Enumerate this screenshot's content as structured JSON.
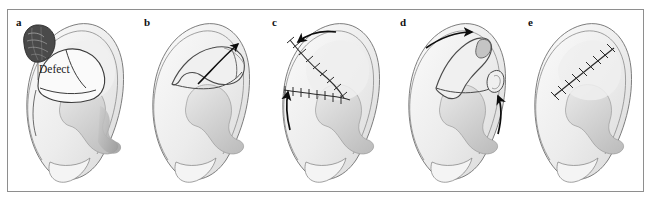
{
  "figure": {
    "type": "medical-illustration",
    "border_color": "#8e8e8e",
    "background_color": "#ffffff",
    "panel_count": 5
  },
  "palette": {
    "outline": "#3b3b3b",
    "outline_light": "#7a7a7a",
    "skin_light": "#f2f2f2",
    "skin_mid": "#e2e2e2",
    "skin_shadow": "#c9c9c9",
    "skin_dark": "#a8a8a8",
    "lesion_dark": "#4a4a4a",
    "lesion_mid": "#6e6e6e",
    "arrow": "#0d0d0d",
    "suture": "#2b2b2b",
    "text": "#111111"
  },
  "panels": [
    {
      "id": "a",
      "label": "a",
      "label_x": 8,
      "label_y": 6,
      "caption_text": "Defect",
      "caption_x": 31,
      "caption_y": 53,
      "has_lesion": true,
      "has_arrow": false,
      "has_sutures": false,
      "description": "Ear with pigmented lesion at superior helix and outlined surgical defect"
    },
    {
      "id": "b",
      "label": "b",
      "label_x": 8,
      "label_y": 6,
      "caption_text": "",
      "has_lesion": false,
      "has_arrow": true,
      "arrow_count": 1,
      "has_sutures": false,
      "description": "Flap incision outlined with single arrow indicating direction of flap transposition"
    },
    {
      "id": "c",
      "label": "c",
      "label_x": 8,
      "label_y": 6,
      "caption_text": "",
      "has_lesion": false,
      "has_arrow": true,
      "arrow_count": 2,
      "has_sutures": true,
      "description": "Flap sutured into position with two arrows showing advancement vectors"
    },
    {
      "id": "d",
      "label": "d",
      "label_x": 8,
      "label_y": 6,
      "caption_text": "",
      "has_lesion": false,
      "has_arrow": true,
      "arrow_count": 2,
      "has_sutures": false,
      "description": "Alternative flap design with two arrows showing rotation and advancement"
    },
    {
      "id": "e",
      "label": "e",
      "label_x": 8,
      "label_y": 6,
      "caption_text": "",
      "has_lesion": false,
      "has_arrow": false,
      "has_sutures": true,
      "description": "Final result with healed diagonal suture line across the scapha"
    }
  ]
}
